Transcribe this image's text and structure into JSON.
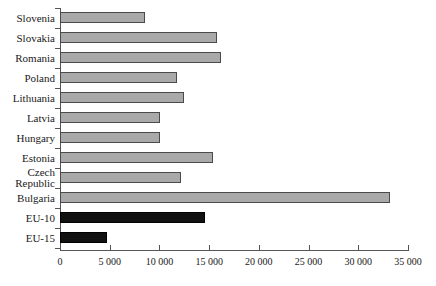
{
  "chart_data": {
    "type": "bar",
    "orientation": "horizontal",
    "title": "",
    "xlabel": "",
    "ylabel": "",
    "xlim": [
      0,
      35000
    ],
    "xticks": [
      0,
      5000,
      10000,
      15000,
      20000,
      25000,
      30000,
      35000
    ],
    "xtick_labels": [
      "0",
      "5 000",
      "10 000",
      "15 000",
      "20 000",
      "25 000",
      "30 000",
      "35 000"
    ],
    "grid": false,
    "legend": null,
    "categories": [
      "Slovenia",
      "Slovakia",
      "Romania",
      "Poland",
      "Lithuania",
      "Latvia",
      "Hungary",
      "Estonia",
      "Czech\nRepublic",
      "Bulgaria",
      "EU-10",
      "EU-15"
    ],
    "values": [
      8550,
      15800,
      16200,
      11800,
      12500,
      10100,
      10100,
      15400,
      12200,
      33200,
      14600,
      4700
    ],
    "bar_styles": [
      "light",
      "light",
      "light",
      "light",
      "light",
      "light",
      "light",
      "light",
      "light",
      "light",
      "dark",
      "dark"
    ],
    "colors": {
      "light_fill": "#a9a9a9",
      "light_edge": "#4a4a4a",
      "dark_fill": "#111111",
      "dark_edge": "#000000",
      "axis": "#555555",
      "text": "#1a1a1a",
      "background": "#ffffff"
    }
  }
}
